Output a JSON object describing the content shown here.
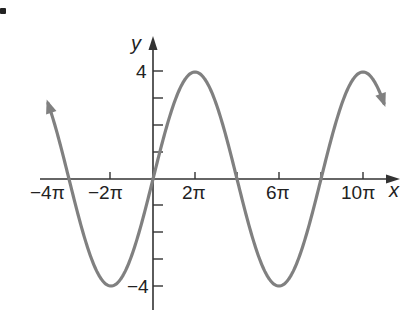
{
  "chart_data": {
    "type": "line",
    "title": "",
    "function": "y = 4 sin(x/4)",
    "xlabel": "x",
    "ylabel": "y",
    "x_ticks": [
      "-4π",
      "-2π",
      "0",
      "2π",
      "4π",
      "6π",
      "8π",
      "10π"
    ],
    "x_tick_labels_shown": [
      "−4π",
      "−2π",
      "2π",
      "6π",
      "10π"
    ],
    "y_ticks": [
      -4,
      -3,
      -2,
      -1,
      0,
      1,
      2,
      3,
      4
    ],
    "y_tick_labels_shown": [
      "4",
      "−4"
    ],
    "xlim_pi": [
      -5,
      11
    ],
    "ylim": [
      -4,
      4
    ],
    "amplitude": 4,
    "period": "8π",
    "series": [
      {
        "name": "y = 4 sin(x/4)",
        "color": "#808080",
        "x_pi": [
          -5,
          -4,
          -2,
          0,
          2,
          4,
          6,
          8,
          10,
          11
        ],
        "y": [
          2.83,
          0,
          -4,
          0,
          4,
          0,
          -4,
          0,
          4,
          2.83
        ]
      }
    ],
    "arrows_on_curve_ends": true,
    "grid": false,
    "legend": null
  },
  "labels": {
    "y_axis": "y",
    "x_axis": "x",
    "y_top": "4",
    "y_bottom": "−4",
    "x_neg4pi": "−4π",
    "x_neg2pi": "−2π",
    "x_2pi": "2π",
    "x_6pi": "6π",
    "x_10pi": "10π"
  },
  "colors": {
    "curve": "#808080",
    "axis": "#333333",
    "text": "#222222"
  }
}
